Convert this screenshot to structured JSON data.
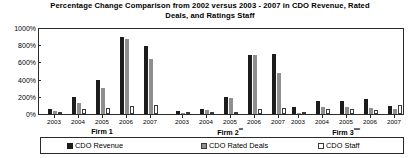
{
  "chart_data": {
    "type": "bar",
    "title": "Percentage Change Comparison from 2002 versus 2003 - 2007 in CDO Revenue, Rated Deals, and Ratings Staff",
    "title_line1": "Percentage Change Comparison from 2002 versus 2003 - 2007 in CDO",
    "title_line2": "Revenue, Rated Deals, and Ratings Staff",
    "xlabel": "",
    "ylabel": "",
    "ylim": [
      0,
      1000
    ],
    "ytick_labels": [
      "0%",
      "200%",
      "400%",
      "600%",
      "800%",
      "1000%"
    ],
    "ytick_values": [
      0,
      200,
      400,
      600,
      800,
      1000
    ],
    "grid": false,
    "legend_position": "bottom",
    "categories": [
      "2003",
      "2004",
      "2005",
      "2006",
      "2007"
    ],
    "groups": [
      {
        "name": "Firm 1",
        "label_base": "Firm 1",
        "label_sup": "",
        "years": [
          "2003",
          "2004",
          "2005",
          "2006",
          "2007"
        ],
        "series": [
          {
            "name": "CDO Revenue",
            "values": [
              55,
              200,
              390,
              900,
              790
            ]
          },
          {
            "name": "CDO Rated Deals",
            "values": [
              30,
              130,
              300,
              870,
              640
            ]
          },
          {
            "name": "CDO Staff",
            "values": [
              20,
              55,
              75,
              90,
              110
            ]
          }
        ]
      },
      {
        "name": "Firm 2**",
        "label_base": "Firm 2",
        "label_sup": "**",
        "years": [
          "2003",
          "2004",
          "2005",
          "2006",
          "2007"
        ],
        "series": [
          {
            "name": "CDO Revenue",
            "values": [
              30,
              55,
              200,
              690,
              700
            ]
          },
          {
            "name": "CDO Rated Deals",
            "values": [
              15,
              50,
              185,
              690,
              480
            ]
          },
          {
            "name": "CDO Staff",
            "values": [
              10,
              15,
              25,
              60,
              70
            ]
          }
        ]
      },
      {
        "name": "Firm 3***",
        "label_base": "Firm 3",
        "label_sup": "***",
        "years": [
          "2003",
          "2004",
          "2005",
          "2006",
          "2007"
        ],
        "series": [
          {
            "name": "CDO Revenue",
            "values": [
              80,
              150,
              150,
              170,
              95
            ]
          },
          {
            "name": "CDO Rated Deals",
            "values": [
              12,
              85,
              80,
              70,
              60
            ]
          },
          {
            "name": "CDO Staff",
            "values": [
              10,
              55,
              60,
              50,
              105
            ]
          }
        ]
      }
    ],
    "series_names": [
      "CDO Revenue",
      "CDO Rated Deals",
      "CDO Staff"
    ],
    "colors": {
      "cdo_revenue": "#1c1c1c",
      "cdo_rated_deals": "#8f8f8f",
      "cdo_staff": "#ffffff",
      "axis": "#2b2b2b",
      "background": "#ffffff"
    }
  },
  "legend": {
    "items": [
      {
        "label": "CDO Revenue",
        "swatch": "black-square-swatch"
      },
      {
        "label": "CDO Rated Deals",
        "swatch": "gray-square-swatch"
      },
      {
        "label": "CDO Staff",
        "swatch": "white-square-swatch"
      }
    ]
  }
}
